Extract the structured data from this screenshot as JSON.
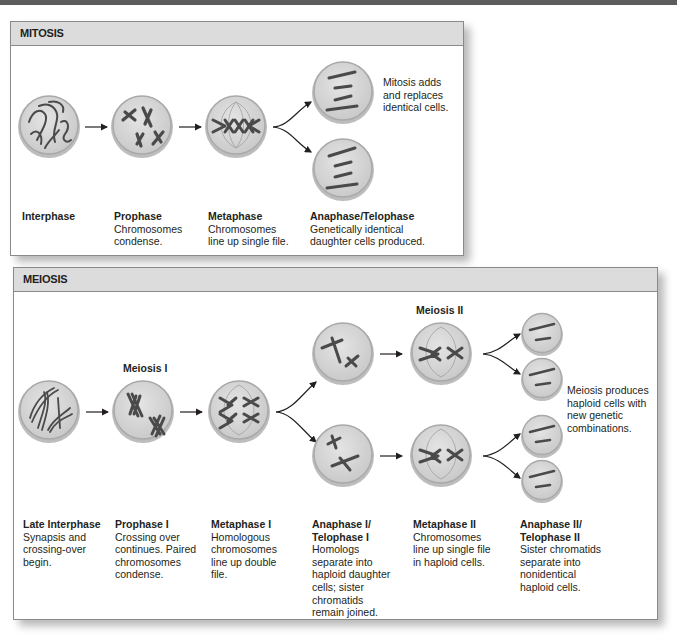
{
  "mitosis": {
    "title": "MITOSIS",
    "stages": [
      {
        "title": "Interphase",
        "desc": ""
      },
      {
        "title": "Prophase",
        "desc": "Chromosomes condense."
      },
      {
        "title": "Metaphase",
        "desc": "Chromosomes line up single file."
      },
      {
        "title": "Anaphase/Telophase",
        "desc": "Genetically identical daughter cells produced."
      }
    ],
    "note": "Mitosis adds and replaces identical cells."
  },
  "meiosis": {
    "title": "MEIOSIS",
    "meiosis_i_label": "Meiosis I",
    "meiosis_ii_label": "Meiosis II",
    "stages": [
      {
        "title": "Late Interphase",
        "desc": "Synapsis and crossing-over begin."
      },
      {
        "title": "Prophase I",
        "desc": "Crossing over continues. Paired chromosomes condense."
      },
      {
        "title": "Metaphase I",
        "desc": "Homologous chromosomes line up double file."
      },
      {
        "title": "Anaphase I/ Telophase I",
        "desc": "Homologs separate into haploid daughter cells; sister chromatids remain joined."
      },
      {
        "title": "Metaphase II",
        "desc": "Chromosomes line up single file in haploid cells."
      },
      {
        "title": "Anaphase II/ Telophase II",
        "desc": "Sister chromatids separate into nonidentical haploid cells."
      }
    ],
    "note": "Meiosis produces haploid cells with new genetic combinations."
  },
  "colors": {
    "header_bg": "#dcdcdc",
    "border": "#8a8a8a",
    "cell_fill": "#d6d6d6",
    "cell_rim": "#a9a9a9",
    "chromosome": "#4a4a4a",
    "top_bar": "#5c5c5c"
  }
}
